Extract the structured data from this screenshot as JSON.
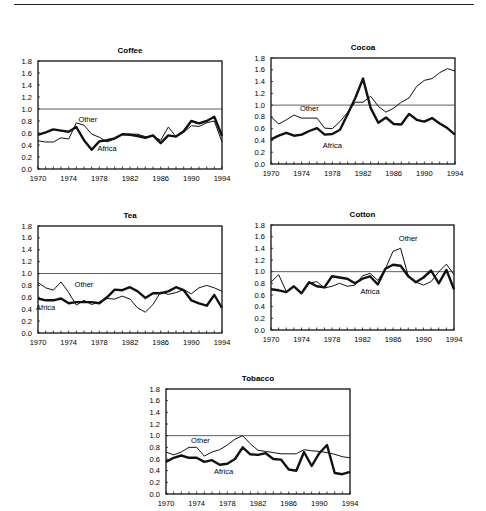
{
  "page": {
    "top_rule": true
  },
  "chart_data": [
    {
      "type": "line",
      "title": "Coffee",
      "xlabel": "",
      "ylabel": "",
      "x": [
        1970,
        1971,
        1972,
        1973,
        1974,
        1975,
        1976,
        1977,
        1978,
        1979,
        1980,
        1981,
        1982,
        1983,
        1984,
        1985,
        1986,
        1987,
        1988,
        1989,
        1990,
        1991,
        1992,
        1993,
        1994
      ],
      "ylim": [
        0,
        1.8
      ],
      "yticks": [
        "0.0",
        "0.2",
        "0.4",
        "0.6",
        "0.8",
        "1.0",
        "1.2",
        "1.4",
        "1.6",
        "1.8"
      ],
      "xticks": [
        "1970",
        "1974",
        "1978",
        "1982",
        "1986",
        "1990",
        "1994"
      ],
      "reference_line": 1.0,
      "series": [
        {
          "name": "Africa",
          "style": "thick",
          "values": [
            0.57,
            0.61,
            0.66,
            0.64,
            0.62,
            0.7,
            0.48,
            0.32,
            0.46,
            0.48,
            0.51,
            0.58,
            0.57,
            0.55,
            0.52,
            0.56,
            0.43,
            0.56,
            0.54,
            0.63,
            0.8,
            0.76,
            0.8,
            0.87,
            0.55
          ]
        },
        {
          "name": "Other",
          "style": "thin",
          "values": [
            0.47,
            0.45,
            0.45,
            0.52,
            0.5,
            0.77,
            0.73,
            0.58,
            0.53,
            0.45,
            0.5,
            0.58,
            0.58,
            0.58,
            0.54,
            0.55,
            0.48,
            0.7,
            0.54,
            0.61,
            0.72,
            0.71,
            0.77,
            0.8,
            0.45
          ]
        }
      ],
      "annotations": [
        {
          "text": "Other",
          "x": 1976.5,
          "y": 0.78
        },
        {
          "text": "Africa",
          "x": 1979,
          "y": 0.3
        }
      ],
      "grid": false
    },
    {
      "type": "line",
      "title": "Cocoa",
      "xlabel": "",
      "ylabel": "",
      "x": [
        1970,
        1971,
        1972,
        1973,
        1974,
        1975,
        1976,
        1977,
        1978,
        1979,
        1980,
        1981,
        1982,
        1983,
        1984,
        1985,
        1986,
        1987,
        1988,
        1989,
        1990,
        1991,
        1992,
        1993,
        1994
      ],
      "ylim": [
        0,
        1.8
      ],
      "yticks": [
        "0.0",
        "0.2",
        "0.4",
        "0.6",
        "0.8",
        "1.0",
        "1.2",
        "1.4",
        "1.6",
        "1.8"
      ],
      "xticks": [
        "1970",
        "1974",
        "1978",
        "1982",
        "1986",
        "1990",
        "1994"
      ],
      "reference_line": 1.0,
      "series": [
        {
          "name": "Africa",
          "style": "thick",
          "values": [
            0.42,
            0.48,
            0.53,
            0.48,
            0.5,
            0.56,
            0.61,
            0.5,
            0.51,
            0.58,
            0.85,
            1.12,
            1.45,
            0.95,
            0.7,
            0.79,
            0.68,
            0.67,
            0.85,
            0.75,
            0.72,
            0.78,
            0.69,
            0.61,
            0.5
          ]
        },
        {
          "name": "Other",
          "style": "thin",
          "values": [
            0.8,
            0.68,
            0.75,
            0.83,
            0.78,
            0.78,
            0.78,
            0.61,
            0.6,
            0.72,
            0.88,
            1.05,
            1.05,
            1.15,
            0.98,
            0.88,
            0.95,
            1.05,
            1.12,
            1.32,
            1.42,
            1.45,
            1.55,
            1.62,
            1.58
          ]
        }
      ],
      "annotations": [
        {
          "text": "Other",
          "x": 1975,
          "y": 0.9
        },
        {
          "text": "Africa",
          "x": 1978,
          "y": 0.28
        }
      ],
      "grid": false
    },
    {
      "type": "line",
      "title": "Tea",
      "xlabel": "",
      "ylabel": "",
      "x": [
        1970,
        1971,
        1972,
        1973,
        1974,
        1975,
        1976,
        1977,
        1978,
        1979,
        1980,
        1981,
        1982,
        1983,
        1984,
        1985,
        1986,
        1987,
        1988,
        1989,
        1990,
        1991,
        1992,
        1993,
        1994
      ],
      "ylim": [
        0,
        1.8
      ],
      "yticks": [
        "0.0",
        "0.2",
        "0.4",
        "0.6",
        "0.8",
        "1.0",
        "1.2",
        "1.4",
        "1.6",
        "1.8"
      ],
      "xticks": [
        "1970",
        "1974",
        "1978",
        "1982",
        "1986",
        "1990",
        "1994"
      ],
      "reference_line": 1.0,
      "series": [
        {
          "name": "Africa",
          "style": "thick",
          "values": [
            0.58,
            0.55,
            0.55,
            0.58,
            0.5,
            0.52,
            0.52,
            0.52,
            0.5,
            0.6,
            0.73,
            0.72,
            0.77,
            0.7,
            0.59,
            0.67,
            0.67,
            0.7,
            0.77,
            0.72,
            0.55,
            0.5,
            0.46,
            0.64,
            0.42
          ]
        },
        {
          "name": "Other",
          "style": "thin",
          "values": [
            0.85,
            0.76,
            0.72,
            0.86,
            0.68,
            0.47,
            0.55,
            0.48,
            0.52,
            0.58,
            0.57,
            0.62,
            0.57,
            0.42,
            0.35,
            0.48,
            0.69,
            0.65,
            0.68,
            0.73,
            0.66,
            0.76,
            0.8,
            0.76,
            0.7
          ]
        }
      ],
      "annotations": [
        {
          "text": "Other",
          "x": 1976,
          "y": 0.78
        },
        {
          "text": "Africa",
          "x": 1971,
          "y": 0.38
        }
      ],
      "grid": false
    },
    {
      "type": "line",
      "title": "Cotton",
      "xlabel": "",
      "ylabel": "",
      "x": [
        1970,
        1971,
        1972,
        1973,
        1974,
        1975,
        1976,
        1977,
        1978,
        1979,
        1980,
        1981,
        1982,
        1983,
        1984,
        1985,
        1986,
        1987,
        1988,
        1989,
        1990,
        1991,
        1992,
        1993,
        1994
      ],
      "ylim": [
        0,
        1.8
      ],
      "yticks": [
        "0.0",
        "0.2",
        "0.4",
        "0.6",
        "0.8",
        "1.0",
        "1.2",
        "1.4",
        "1.6",
        "1.8"
      ],
      "xticks": [
        "1970",
        "1974",
        "1978",
        "1982",
        "1986",
        "1990",
        "1994"
      ],
      "reference_line": 1.0,
      "series": [
        {
          "name": "Africa",
          "style": "thick",
          "values": [
            0.7,
            0.68,
            0.65,
            0.75,
            0.63,
            0.82,
            0.75,
            0.73,
            0.92,
            0.9,
            0.88,
            0.8,
            0.88,
            0.92,
            0.78,
            1.05,
            1.12,
            1.1,
            0.92,
            0.82,
            0.9,
            1.02,
            0.8,
            1.03,
            0.7
          ]
        },
        {
          "name": "Other",
          "style": "thin",
          "values": [
            0.82,
            0.95,
            0.66,
            0.75,
            0.63,
            0.8,
            0.83,
            0.72,
            0.75,
            0.8,
            0.75,
            0.77,
            0.93,
            0.97,
            0.85,
            1.05,
            1.35,
            1.4,
            0.92,
            0.82,
            0.77,
            0.83,
            1.0,
            1.13,
            0.95
          ]
        }
      ],
      "annotations": [
        {
          "text": "Other",
          "x": 1988,
          "y": 1.52
        },
        {
          "text": "Africa",
          "x": 1983,
          "y": 0.62
        }
      ],
      "grid": false
    },
    {
      "type": "line",
      "title": "Tobacco",
      "xlabel": "",
      "ylabel": "",
      "x": [
        1970,
        1971,
        1972,
        1973,
        1974,
        1975,
        1976,
        1977,
        1978,
        1979,
        1980,
        1981,
        1982,
        1983,
        1984,
        1985,
        1986,
        1987,
        1988,
        1989,
        1990,
        1991,
        1992,
        1993,
        1994
      ],
      "ylim": [
        0,
        1.8
      ],
      "yticks": [
        "0.0",
        "0.2",
        "0.4",
        "0.6",
        "0.8",
        "1.0",
        "1.2",
        "1.4",
        "1.6",
        "1.8"
      ],
      "xticks": [
        "1970",
        "1974",
        "1978",
        "1982",
        "1986",
        "1990",
        "1994"
      ],
      "reference_line": 1.0,
      "series": [
        {
          "name": "Africa",
          "style": "thick",
          "values": [
            0.55,
            0.62,
            0.66,
            0.62,
            0.62,
            0.55,
            0.58,
            0.5,
            0.52,
            0.6,
            0.8,
            0.68,
            0.67,
            0.7,
            0.6,
            0.59,
            0.42,
            0.4,
            0.72,
            0.48,
            0.7,
            0.84,
            0.36,
            0.34,
            0.38
          ]
        },
        {
          "name": "Other",
          "style": "thin",
          "values": [
            0.72,
            0.67,
            0.72,
            0.8,
            0.8,
            0.65,
            0.72,
            0.76,
            0.84,
            0.94,
            1.0,
            0.86,
            0.75,
            0.73,
            0.71,
            0.69,
            0.69,
            0.69,
            0.76,
            0.74,
            0.73,
            0.71,
            0.68,
            0.64,
            0.62
          ]
        }
      ],
      "annotations": [
        {
          "text": "Other",
          "x": 1974.5,
          "y": 0.88
        },
        {
          "text": "Africa",
          "x": 1977.5,
          "y": 0.35
        }
      ],
      "grid": false
    }
  ]
}
